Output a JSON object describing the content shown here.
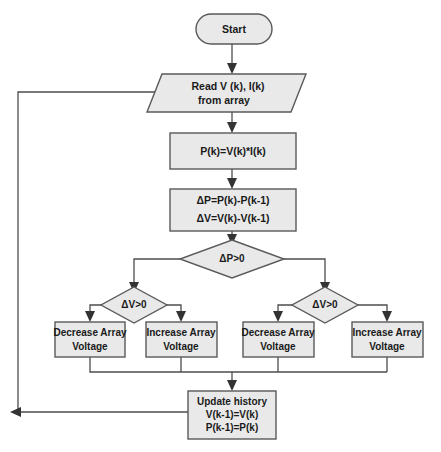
{
  "diagram": {
    "type": "flowchart",
    "colors": {
      "node_fill": "#e9e9e9",
      "node_stroke": "#595959",
      "connector": "#4d4d4d",
      "text": "#1a1a1a",
      "background": "#ffffff"
    },
    "nodes": {
      "start": {
        "shape": "terminator",
        "label": "Start"
      },
      "read": {
        "shape": "parallelogram",
        "line1": "Read V (k), I(k)",
        "line2": "from array"
      },
      "power": {
        "shape": "process",
        "label": "P(k)=V(k)*I(k)"
      },
      "deltas": {
        "shape": "process",
        "line1": "ΔP=P(k)-P(k-1)",
        "line2": "ΔV=V(k)-V(k-1)"
      },
      "decision_dp": {
        "shape": "decision",
        "label": "ΔP>0"
      },
      "decision_dv_left": {
        "shape": "decision",
        "label": "ΔV>0"
      },
      "decision_dv_right": {
        "shape": "decision",
        "label": "ΔV>0"
      },
      "action_1": {
        "shape": "process",
        "line1": "Decrease Array",
        "line2": "Voltage"
      },
      "action_2": {
        "shape": "process",
        "line1": "Increase Array",
        "line2": "Voltage"
      },
      "action_3": {
        "shape": "process",
        "line1": "Decrease Array",
        "line2": "Voltage"
      },
      "action_4": {
        "shape": "process",
        "line1": "Increase Array",
        "line2": "Voltage"
      },
      "update": {
        "shape": "process",
        "line1": "Update history",
        "line2": "V(k-1)=V(k)",
        "line3": "P(k-1)=P(k)"
      }
    }
  }
}
